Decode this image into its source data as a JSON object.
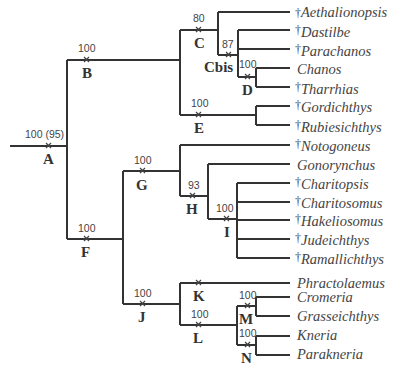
{
  "figure": {
    "type": "cladogram",
    "extinct_symbol": "†"
  },
  "nodes": {
    "A": {
      "label": "A",
      "support": "100 (95)"
    },
    "B": {
      "label": "B",
      "support": "100"
    },
    "C": {
      "label": "C",
      "support": "80"
    },
    "Cbis": {
      "label": "Cbis",
      "support": "87"
    },
    "D": {
      "label": "D",
      "support": "100"
    },
    "E": {
      "label": "E",
      "support": "100"
    },
    "F": {
      "label": "F",
      "support": "100"
    },
    "G": {
      "label": "G",
      "support": "100"
    },
    "H": {
      "label": "H",
      "support": "93"
    },
    "I": {
      "label": "I",
      "support": "100"
    },
    "J": {
      "label": "J",
      "support": "100"
    },
    "K": {
      "label": "K",
      "support": ""
    },
    "L": {
      "label": "L",
      "support": "100"
    },
    "M": {
      "label": "M",
      "support": "100"
    },
    "N": {
      "label": "N",
      "support": "100"
    }
  },
  "taxa": [
    {
      "name": "Aethalionopsis",
      "extinct": true
    },
    {
      "name": "Dastilbe",
      "extinct": true
    },
    {
      "name": "Parachanos",
      "extinct": true
    },
    {
      "name": "Chanos",
      "extinct": false
    },
    {
      "name": "Tharrhias",
      "extinct": true
    },
    {
      "name": "Gordichthys",
      "extinct": true
    },
    {
      "name": "Rubiesichthys",
      "extinct": true
    },
    {
      "name": "Notogoneus",
      "extinct": true
    },
    {
      "name": "Gonorynchus",
      "extinct": false
    },
    {
      "name": "Charitopsis",
      "extinct": true
    },
    {
      "name": "Charitosomus",
      "extinct": true
    },
    {
      "name": "Hakeliosomus",
      "extinct": true
    },
    {
      "name": "Judeichthys",
      "extinct": true
    },
    {
      "name": "Ramallichthys",
      "extinct": true
    },
    {
      "name": "Phractolaemus",
      "extinct": false
    },
    {
      "name": "Cromeria",
      "extinct": false
    },
    {
      "name": "Grasseichthys",
      "extinct": false
    },
    {
      "name": "Kneria",
      "extinct": false
    },
    {
      "name": "Parakneria",
      "extinct": false
    }
  ],
  "dagger": "†"
}
